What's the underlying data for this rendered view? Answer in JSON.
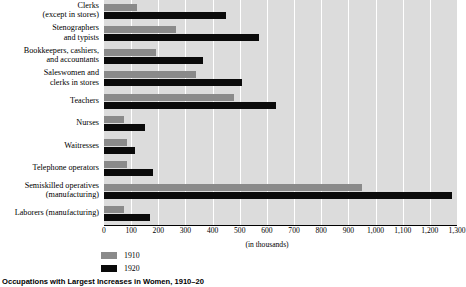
{
  "chart_data": {
    "type": "bar",
    "orientation": "horizontal",
    "title": "Occupations with Largest Increases in Women, 1910–20",
    "xlabel": "(in thousands)",
    "ylabel": "",
    "xlim": [
      0,
      1300
    ],
    "xticks": [
      0,
      100,
      200,
      300,
      400,
      500,
      600,
      700,
      800,
      900,
      1000,
      1100,
      1200,
      1300
    ],
    "xticklabels": [
      "0",
      "100",
      "200",
      "300",
      "400",
      "500",
      "600",
      "700",
      "800",
      "900",
      "1,000",
      "1,100",
      "1,200",
      "1,300"
    ],
    "grid": true,
    "grid_color": "#ffffff",
    "plot_background": "#dcdcdc",
    "legend_position": "bottom-left",
    "categories": [
      {
        "line1": "Clerks",
        "line2": "(except in stores)"
      },
      {
        "line1": "Stenographers",
        "line2": "and typists"
      },
      {
        "line1": "Bookkeepers, cashiers,",
        "line2": "and accountants"
      },
      {
        "line1": "Saleswomen and",
        "line2": "clerks in stores"
      },
      {
        "line1": "Teachers",
        "line2": ""
      },
      {
        "line1": "Nurses",
        "line2": ""
      },
      {
        "line1": "Waitresses",
        "line2": ""
      },
      {
        "line1": "Telephone operators",
        "line2": ""
      },
      {
        "line1": "Semiskilled operatives",
        "line2": "(manufacturing)"
      },
      {
        "line1": "Laborers (manufacturing)",
        "line2": ""
      }
    ],
    "series": [
      {
        "name": "1910",
        "color": "#8a8a8a",
        "values": [
          120,
          265,
          190,
          340,
          480,
          75,
          85,
          85,
          950,
          75
        ]
      },
      {
        "name": "1920",
        "color": "#0a0a0a",
        "values": [
          450,
          570,
          365,
          510,
          635,
          150,
          115,
          180,
          1280,
          170
        ]
      }
    ]
  },
  "legend": {
    "items": [
      {
        "label": "1910",
        "color": "#8a8a8a"
      },
      {
        "label": "1920",
        "color": "#0a0a0a"
      }
    ]
  },
  "caption": {
    "text": "Occupations with Largest Increases in Women, 1910–20"
  }
}
